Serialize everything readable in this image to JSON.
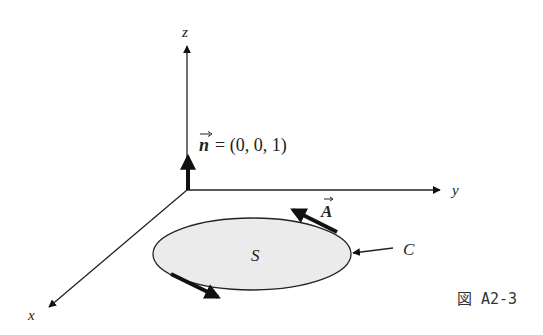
{
  "figure": {
    "caption": "図 A2-3",
    "axes": {
      "x_label": "x",
      "y_label": "y",
      "z_label": "z"
    },
    "normal_vector": {
      "symbol": "n",
      "equation": "= (0, 0, 1)"
    },
    "surface_label": "S",
    "curve_label": "C",
    "tangent_vector_label": "A",
    "colors": {
      "line": "#111111",
      "surface_fill": "#ebebeb",
      "text": "#222222"
    }
  }
}
